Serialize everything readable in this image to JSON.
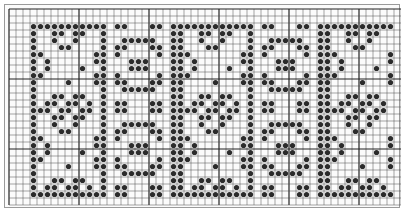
{
  "chart_data": {
    "type": "table",
    "title": "",
    "grid": {
      "origin_x": 8,
      "origin_y": 8,
      "cell": 7,
      "cols": 56,
      "rows": 28,
      "line_color": "#4a4a4a",
      "thick_line_color": "#222222",
      "thick_every": 10
    },
    "dot_color": "#2b2b2b",
    "pattern_rows": {
      "start": 2,
      "end": 26
    },
    "panels": [
      {
        "name": "dense-x-diamond",
        "col_start": 3,
        "width": 10,
        "border_right": true
      },
      {
        "name": "border-column",
        "col_start": 13,
        "width": 1
      },
      {
        "name": "open-diamond-circle",
        "col_start": 15,
        "width": 7
      },
      {
        "name": "border-column",
        "col_start": 23,
        "width": 1
      },
      {
        "name": "dense-x-diamond",
        "col_start": 24,
        "width": 10,
        "border_right": true
      },
      {
        "name": "border-column",
        "col_start": 34,
        "width": 1
      },
      {
        "name": "open-diamond-circle",
        "col_start": 36,
        "width": 7
      },
      {
        "name": "border-column",
        "col_start": 44,
        "width": 1
      },
      {
        "name": "dense-x-diamond",
        "col_start": 45,
        "width": 10,
        "border_right": true
      }
    ]
  }
}
